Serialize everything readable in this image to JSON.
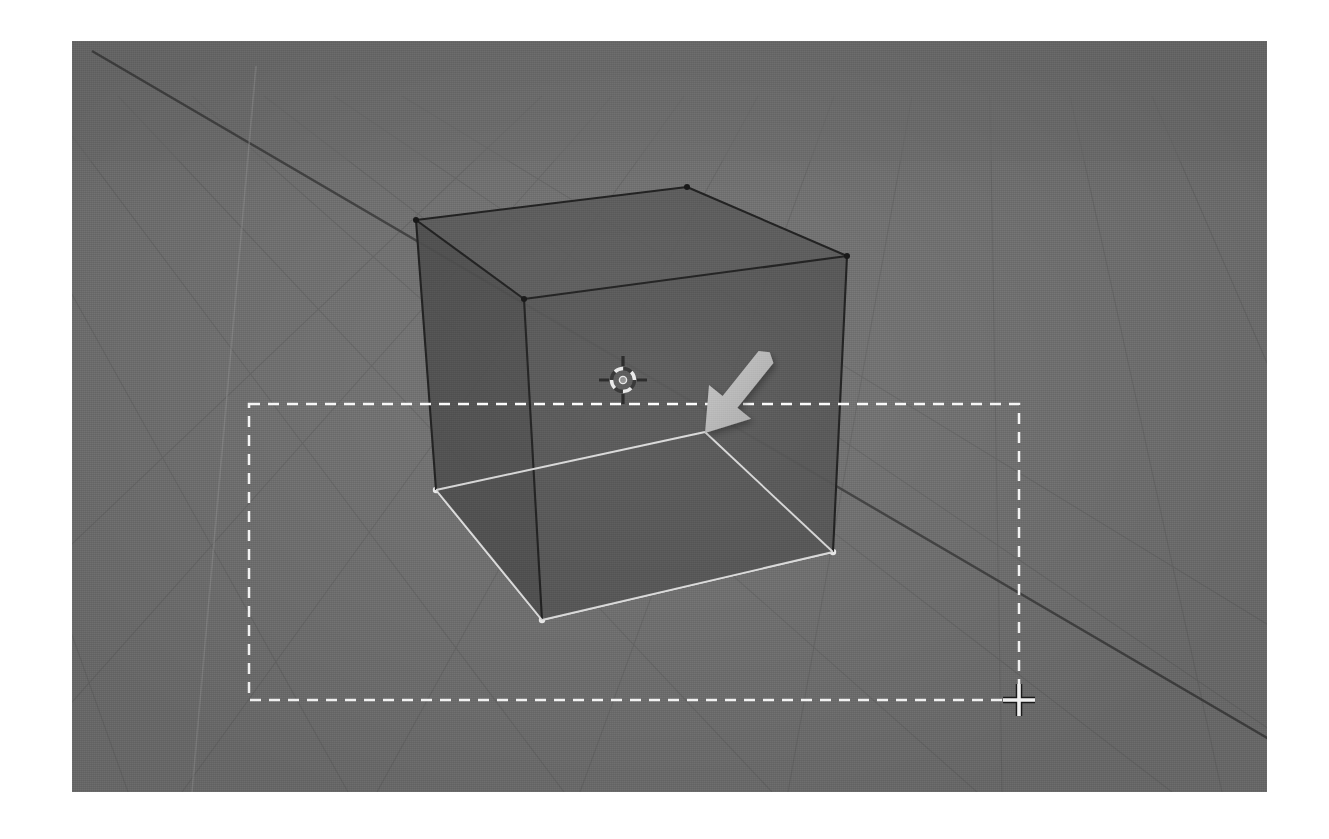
{
  "app": {
    "name": "blender-3d-viewport",
    "window_title": "3D Viewport",
    "shading_mode": "Solid",
    "view_type": "User Perspective"
  },
  "canvas": {
    "width": 1329,
    "height": 839,
    "page_background": "#ffffff"
  },
  "viewport": {
    "x": 72,
    "y": 41,
    "width": 1195,
    "height": 751,
    "background_color": "#707070",
    "grid_line_color": "#5f5f5f",
    "axis_line_color": "#3b3b3b",
    "z_axis_line_color": "#8e8e8e"
  },
  "grid": {
    "label": "floor-grid",
    "visible": true,
    "horizon_y": 96,
    "vanishing_x": 352,
    "subdivision_count": 12
  },
  "object": {
    "name": "Cube",
    "type": "mesh",
    "selected": true,
    "wireframe_color": "#1c1c1c",
    "select_outline_color": "#e6e6e6",
    "faces": {
      "top_fill": "#5a5a5a",
      "left_fill": "#4b4b4b",
      "right_fill": "#545454",
      "base_fill": "#7c7c7c"
    },
    "vertices_screen": {
      "top_left": [
        416,
        220
      ],
      "top_back": [
        687,
        187
      ],
      "top_right": [
        847,
        256
      ],
      "top_front": [
        524,
        299
      ],
      "bottom_left": [
        436,
        490
      ],
      "bottom_front": [
        542,
        620
      ],
      "bottom_right": [
        833,
        552
      ],
      "bottom_back": [
        705,
        432
      ]
    }
  },
  "cursor_3d": {
    "name": "3d-cursor",
    "x": 623,
    "y": 380,
    "radius": 13,
    "ring_color_a": "#e4e4e4",
    "ring_color_b": "#3a3a3a",
    "crosshair_color": "#2a2a2a"
  },
  "mouse_pointer": {
    "name": "arrow-pointer",
    "tip_x": 705,
    "tip_y": 433,
    "tail_x": 766,
    "tail_y": 357,
    "color": "#b4b4b4",
    "shadow_color": "rgba(0,0,0,0.28)",
    "direction": "down-left"
  },
  "selection_box": {
    "name": "box-select-rectangle",
    "left": 249,
    "top": 404,
    "right": 1019,
    "bottom": 700,
    "stroke_color": "#ffffff",
    "dash": "11 8",
    "stroke_width": 2.5,
    "active": true
  },
  "crosshair_cursor": {
    "name": "box-select-crosshair",
    "x": 1019,
    "y": 700,
    "arm_length": 16,
    "color": "#ffffff",
    "outline_color": "#1a1a1a"
  },
  "status": {
    "operation": "Box Select",
    "mode": "Object Mode"
  }
}
